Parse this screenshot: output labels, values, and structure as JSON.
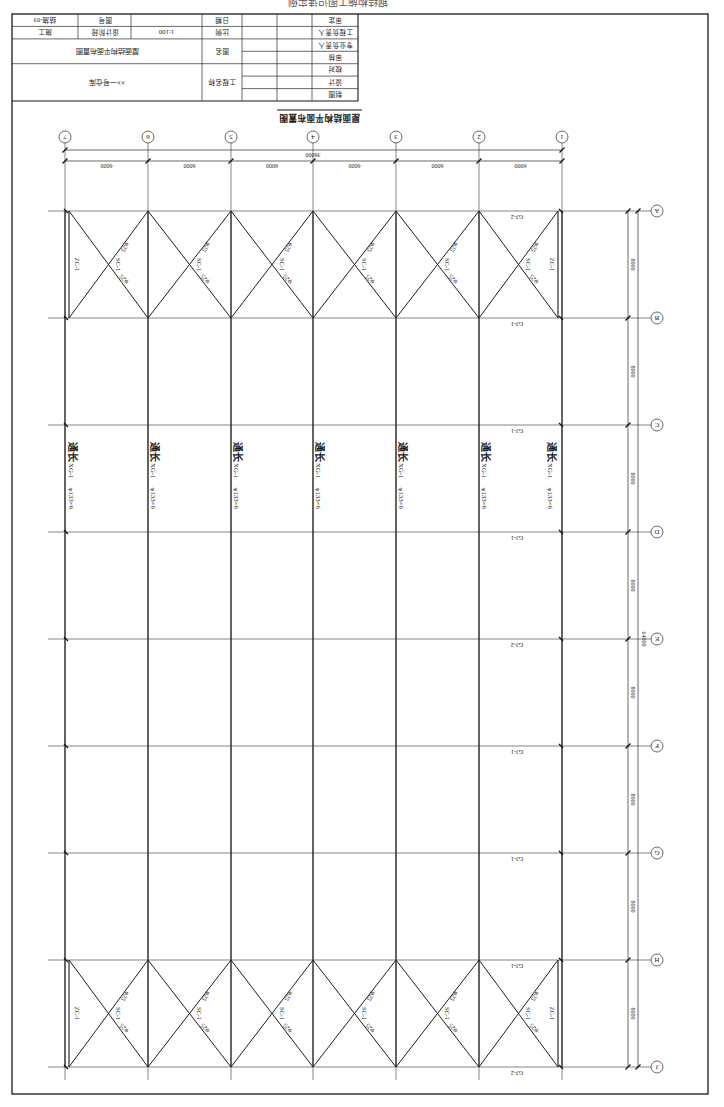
{
  "page_header": "钢结构施工图识读实例",
  "title_block": {
    "drawing_no_value": "结施-03",
    "drawing_no_label": "图号",
    "stage_value": "施工",
    "stage_label": "设计阶段",
    "scale_value": "1:100",
    "scale_label": "比例",
    "date_label": "日期",
    "drawing_name_label": "图名",
    "drawing_name": "屋面结构平面布置图",
    "project_name_label": "工程名称",
    "project_name": "××一号仓库",
    "signoff_roles": [
      "审定",
      "工程负责人",
      "专业负责人",
      "审核",
      "校对",
      "设计",
      "制图"
    ]
  },
  "drawing": {
    "title": "屋面结构平面布置图",
    "column_axes": [
      "1",
      "2",
      "3",
      "4",
      "5",
      "6",
      "7"
    ],
    "row_axes": [
      "A",
      "B",
      "C",
      "D",
      "E",
      "F",
      "G",
      "H",
      "J"
    ],
    "dims_top": {
      "overall": "36000",
      "bays": [
        "6000",
        "6000",
        "6000",
        "6000",
        "6000",
        "6000"
      ]
    },
    "dims_right": {
      "overall": "64000",
      "spans": [
        "8000",
        "8000",
        "8000",
        "8000",
        "8000",
        "8000",
        "8000",
        "8000"
      ]
    },
    "trusses": [
      "GJ-2",
      "GJ-1",
      "GJ-1",
      "GJ-1",
      "GJ-2",
      "GJ-1",
      "GJ-1",
      "GJ-1",
      "GJ-2"
    ],
    "purlins": [
      {
        "axis": "1",
        "name": "通长",
        "code": "XG-1",
        "section": "φ133×6"
      },
      {
        "axis": "2",
        "name": "通长",
        "code": "XG-1",
        "section": "φ133×6"
      },
      {
        "axis": "3",
        "name": "通长",
        "code": "XG-1",
        "section": "φ133×6"
      },
      {
        "axis": "4",
        "name": "通长",
        "code": "XG-1",
        "section": "φ133×6"
      },
      {
        "axis": "5",
        "name": "通长",
        "code": "XG-1",
        "section": "φ133×6"
      },
      {
        "axis": "6",
        "name": "通长",
        "code": "XG-1",
        "section": "φ133×6"
      },
      {
        "axis": "7",
        "name": "通长",
        "code": "XG-1",
        "section": "φ133×6"
      }
    ],
    "roof_bracing_top": [
      {
        "code": "SC-1",
        "rod_a": "φ25",
        "rod_b": "φ25"
      },
      {
        "code": "SC-1",
        "rod_a": "φ25",
        "rod_b": "φ25"
      },
      {
        "code": "SC-1",
        "rod_a": "φ25",
        "rod_b": "φ25"
      },
      {
        "code": "SC-1",
        "rod_a": "φ25",
        "rod_b": "φ25"
      },
      {
        "code": "SC-1",
        "rod_a": "φ25",
        "rod_b": "φ25"
      },
      {
        "code": "SC-1",
        "rod_a": "φ25",
        "rod_b": "φ25"
      }
    ],
    "roof_bracing_bottom": [
      {
        "code": "SC-1",
        "rod_a": "φ25",
        "rod_b": "φ25"
      },
      {
        "code": "SC-1",
        "rod_a": "φ25",
        "rod_b": "φ25"
      },
      {
        "code": "SC-1",
        "rod_a": "φ25",
        "rod_b": "φ25"
      },
      {
        "code": "SC-1",
        "rod_a": "φ25",
        "rod_b": "φ25"
      },
      {
        "code": "SC-1",
        "rod_a": "φ25",
        "rod_b": "φ25"
      },
      {
        "code": "SC-1",
        "rod_a": "φ25",
        "rod_b": "φ25"
      }
    ],
    "column_bracing": [
      {
        "axis": "1",
        "span": "A-B",
        "code": "ZC-1"
      },
      {
        "axis": "1",
        "span": "H-J",
        "code": "ZC-1"
      },
      {
        "axis": "7",
        "span": "A-B",
        "code": "ZC-1"
      },
      {
        "axis": "7",
        "span": "H-J",
        "code": "ZC-1"
      }
    ]
  }
}
